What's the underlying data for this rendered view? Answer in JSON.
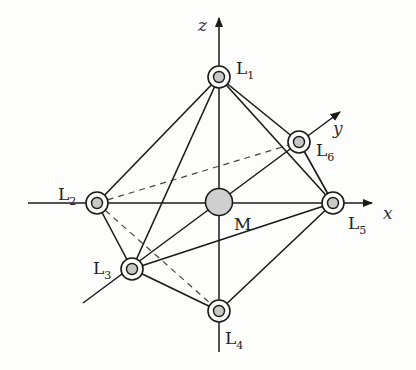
{
  "diagram": {
    "type": "octahedral-complex",
    "colors": {
      "line": "#1a1a1a",
      "node_fill": "#c8c8c8",
      "metal_fill": "#cfcfcf",
      "background": "#fdfdfb"
    },
    "axes": [
      {
        "name": "z",
        "label": "z"
      },
      {
        "name": "y",
        "label": "y"
      },
      {
        "name": "x",
        "label": "x"
      }
    ],
    "center": {
      "id": "M",
      "label": "M"
    },
    "ligands": [
      {
        "id": "L1",
        "label": "L",
        "sub": "1"
      },
      {
        "id": "L2",
        "label": "L",
        "sub": "2"
      },
      {
        "id": "L3",
        "label": "L",
        "sub": "3"
      },
      {
        "id": "L4",
        "label": "L",
        "sub": "4"
      },
      {
        "id": "L5",
        "label": "L",
        "sub": "5"
      },
      {
        "id": "L6",
        "label": "L",
        "sub": "6"
      }
    ],
    "solid_edges": [
      [
        "L1",
        "L2"
      ],
      [
        "L1",
        "L3"
      ],
      [
        "L1",
        "L5"
      ],
      [
        "L1",
        "L6"
      ],
      [
        "L2",
        "L3"
      ],
      [
        "L3",
        "L4"
      ],
      [
        "L3",
        "L5"
      ],
      [
        "L3",
        "M"
      ],
      [
        "L4",
        "L5"
      ],
      [
        "L5",
        "L6"
      ]
    ],
    "dashed_edges": [
      [
        "L2",
        "L6"
      ],
      [
        "L2",
        "L4"
      ]
    ]
  }
}
